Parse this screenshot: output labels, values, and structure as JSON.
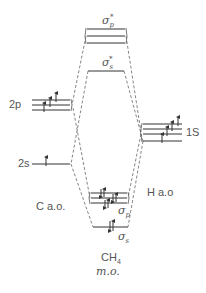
{
  "diagram": {
    "type": "molecular-orbital-energy-diagram",
    "molecule": "CH4",
    "colors": {
      "line": "#333333",
      "dash": "#666666",
      "text": "#555555"
    },
    "left_atomic_orbitals": {
      "label": "C a.o.",
      "levels": [
        {
          "label": "2p",
          "degeneracy": 3,
          "electrons": 2
        },
        {
          "label": "2s",
          "degeneracy": 1,
          "electrons": 1
        }
      ]
    },
    "right_atomic_orbitals": {
      "label": "H a.o",
      "levels": [
        {
          "label": "1S",
          "degeneracy": 4,
          "electrons": 4
        }
      ]
    },
    "molecular_orbitals": {
      "label_line1": "CH",
      "label_sub": "4",
      "label_line2": "m.o.",
      "levels": [
        {
          "label": "σ",
          "sub": "p",
          "sup": "*",
          "degeneracy": 3,
          "electrons": 0
        },
        {
          "label": "σ",
          "sub": "s",
          "sup": "*",
          "degeneracy": 1,
          "electrons": 0
        },
        {
          "label": "σ",
          "sub": "p",
          "sup": "",
          "degeneracy": 3,
          "electrons": 6
        },
        {
          "label": "σ",
          "sub": "s",
          "sup": "",
          "degeneracy": 1,
          "electrons": 2
        }
      ]
    }
  }
}
